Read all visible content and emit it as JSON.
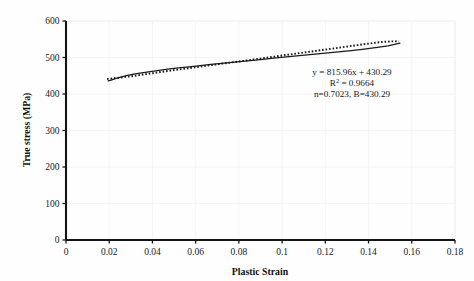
{
  "chart_data": {
    "type": "line",
    "title": "",
    "xlabel": "Plastic Strain",
    "ylabel": "True stress (MPa)",
    "xlim": [
      0,
      0.18
    ],
    "ylim": [
      0,
      600
    ],
    "xticks": [
      "0",
      "0.02",
      "0.04",
      "0.06",
      "0.08",
      "0.1",
      "0.12",
      "0.14",
      "0.16",
      "0.18"
    ],
    "xtick_values": [
      0,
      0.02,
      0.04,
      0.06,
      0.08,
      0.1,
      0.12,
      0.14,
      0.16,
      0.18
    ],
    "yticks": [
      "0",
      "100",
      "200",
      "300",
      "400",
      "500",
      "600"
    ],
    "ytick_values": [
      0,
      100,
      200,
      300,
      400,
      500,
      600
    ],
    "grid": true,
    "grid_color": "#f2f2f2",
    "legend": "none",
    "series": [
      {
        "name": "Experimental true stress-strain (solid)",
        "style": "solid",
        "color": "#1a1a1a",
        "x": [
          0.0195,
          0.0205,
          0.0215,
          0.0228,
          0.0245,
          0.0265,
          0.029,
          0.032,
          0.035,
          0.039,
          0.043,
          0.047,
          0.052,
          0.057,
          0.062,
          0.067,
          0.072,
          0.078,
          0.084,
          0.09,
          0.096,
          0.102,
          0.108,
          0.114,
          0.12,
          0.126,
          0.132,
          0.138,
          0.144,
          0.149,
          0.1545
        ],
        "y": [
          436.0,
          437.5,
          439.5,
          442.0,
          445.0,
          448.0,
          451.5,
          455.0,
          458.0,
          461.5,
          465.0,
          468.0,
          471.5,
          474.5,
          478.0,
          481.0,
          484.0,
          487.5,
          491.0,
          494.5,
          498.0,
          501.5,
          505.0,
          508.5,
          512.0,
          515.5,
          519.0,
          523.0,
          527.5,
          532.0,
          539.5
        ]
      },
      {
        "name": "Hollomon fit y = 815.96x + 430.29 (dotted)",
        "style": "dotted",
        "color": "#1a1a1a",
        "x": [
          0.019,
          0.0215,
          0.0245,
          0.028,
          0.032,
          0.036,
          0.04,
          0.0445,
          0.049,
          0.054,
          0.059,
          0.064,
          0.069,
          0.0745,
          0.08,
          0.0855,
          0.091,
          0.0965,
          0.102,
          0.1075,
          0.113,
          0.1185,
          0.124,
          0.1295,
          0.135,
          0.1405,
          0.146,
          0.15,
          0.154
        ],
        "y": [
          441.0,
          442.5,
          444.5,
          447.0,
          450.0,
          453.5,
          457.0,
          461.0,
          464.5,
          468.5,
          472.5,
          476.5,
          480.5,
          485.0,
          489.0,
          493.5,
          498.0,
          502.5,
          507.0,
          511.5,
          516.0,
          520.5,
          525.0,
          529.5,
          534.0,
          538.5,
          542.5,
          544.0,
          544.5
        ]
      }
    ],
    "annotation": {
      "line1": "y = 815.96x + 430.29",
      "line2_prefix": "R",
      "line2_sup": "2",
      "line2_suffix": " = 0.9664",
      "line3": "n=0.7023, B=430.29"
    }
  }
}
